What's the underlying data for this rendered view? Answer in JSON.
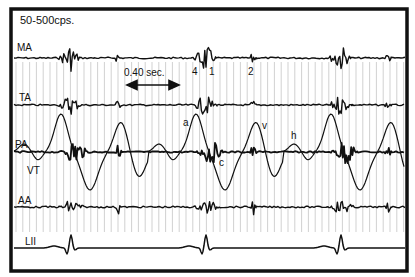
{
  "chart_data": {
    "type": "line",
    "title": "",
    "filter_label": "50-500cps.",
    "time_scale": {
      "label": "0.40 sec.",
      "arrow": "double-headed"
    },
    "xlabel": "",
    "ylabel": "",
    "grid": "vertical timing lines",
    "series": [
      {
        "name": "MA",
        "kind": "phonocardiogram (mitral area)",
        "baseline_y": 58
      },
      {
        "name": "TA",
        "kind": "phonocardiogram (tricuspid area)",
        "baseline_y": 105
      },
      {
        "name": "PA",
        "kind": "phonocardiogram (pulmonary area)",
        "baseline_y": 152
      },
      {
        "name": "VT",
        "kind": "venous tracing (jugular pulse)",
        "baseline_y": 152
      },
      {
        "name": "AA",
        "kind": "phonocardiogram (aortic area)",
        "baseline_y": 207
      },
      {
        "name": "LII",
        "kind": "ECG lead II",
        "baseline_y": 248
      }
    ],
    "annotations": [
      {
        "text": "4",
        "target": "MA",
        "meaning": "fourth heart sound"
      },
      {
        "text": "1",
        "target": "MA",
        "meaning": "first heart sound"
      },
      {
        "text": "2",
        "target": "MA",
        "meaning": "second heart sound"
      },
      {
        "text": "a",
        "target": "VT",
        "meaning": "a wave"
      },
      {
        "text": "c",
        "target": "VT",
        "meaning": "c wave"
      },
      {
        "text": "v",
        "target": "VT",
        "meaning": "v wave"
      },
      {
        "text": "h",
        "target": "VT",
        "meaning": "h wave"
      }
    ],
    "cardiac_cycles_visible": 3
  },
  "labels": {
    "filter": "50-500cps.",
    "time_scale": "0.40 sec.",
    "ma": "MA",
    "ta": "TA",
    "pa": "PA",
    "vt": "VT",
    "aa": "AA",
    "lii": "LII",
    "s4": "4",
    "s1": "1",
    "s2": "2",
    "wave_a": "a",
    "wave_c": "c",
    "wave_v": "v",
    "wave_h": "h"
  },
  "colors": {
    "trace": "#111111",
    "frame": "#111111",
    "grid": "#bdbdbd",
    "background": "#ffffff"
  }
}
